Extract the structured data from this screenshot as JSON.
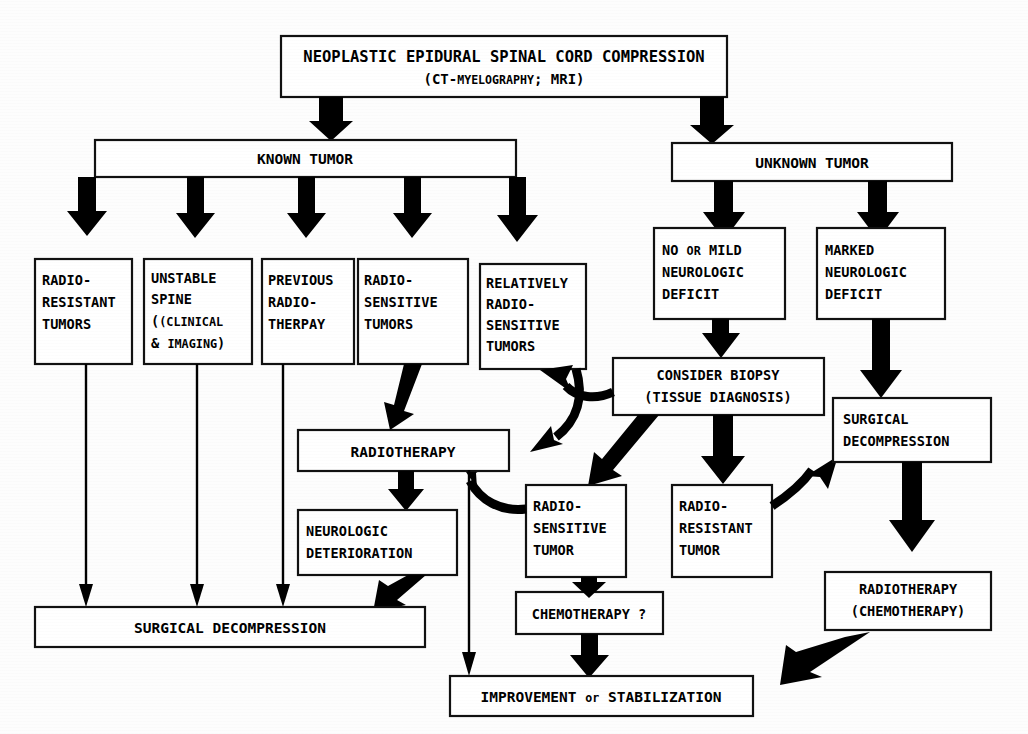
{
  "diagram": {
    "type": "flowchart",
    "root": {
      "line1": "NEOPLASTIC EPIDURAL SPINAL CORD COMPRESSION",
      "line2_a": "(CT-",
      "line2_b": "MYELOGRAPHY",
      "line2_c": "; MRI)"
    },
    "branches": {
      "known": "KNOWN   TUMOR",
      "unknown": "UNKNOWN   TUMOR"
    },
    "known_children": [
      {
        "id": "radio-resistant-tumors",
        "lines": [
          "RADIO-",
          "RESISTANT",
          "TUMORS"
        ]
      },
      {
        "id": "unstable-spine",
        "lines": [
          "UNSTABLE",
          "SPINE"
        ],
        "small_caps_lines": [
          "(CLINICAL",
          "& IMAGING)"
        ]
      },
      {
        "id": "previous-radiotherapy",
        "lines": [
          "PREVIOUS",
          "RADIO-",
          "THERPAY"
        ]
      },
      {
        "id": "radio-sensitive-tumors",
        "lines": [
          "RADIO-",
          "SENSITIVE",
          "TUMORS"
        ]
      },
      {
        "id": "relatively-radio-sensitive-tumors",
        "lines": [
          "RELATIVELY",
          "RADIO-",
          "SENSITIVE",
          "TUMORS"
        ]
      }
    ],
    "unknown_children": [
      {
        "id": "no-or-mild-deficit",
        "lines": [
          "NO or MILD",
          "NEUROLOGIC",
          "DEFICIT"
        ]
      },
      {
        "id": "marked-deficit",
        "lines": [
          "MARKED",
          "NEUROLOGIC",
          "DEFICIT"
        ]
      }
    ],
    "nodes": {
      "radiotherapy": "RADIOTHERAPY",
      "neurologic_deterioration": [
        "NEUROLOGIC",
        "DETERIORATION"
      ],
      "consider_biopsy": [
        "CONSIDER BIOPSY",
        "(TISSUE DIAGNOSIS)"
      ],
      "mid_radio_sensitive_tumor": [
        "RADIO-",
        "SENSITIVE",
        "TUMOR"
      ],
      "mid_radio_resistant_tumor": [
        "RADIO-",
        "RESISTANT",
        "TUMOR"
      ],
      "surgical_decompression_right": [
        "SURGICAL",
        "DECOMPRESSION"
      ],
      "radiotherapy_chemotherapy": [
        "RADIOTHERAPY",
        "(CHEMOTHERAPY)"
      ],
      "chemotherapy_question": "CHEMOTHERAPY ?",
      "surgical_decompression_bottom": "SURGICAL   DECOMPRESSION",
      "improvement": {
        "a": "IMPROVEMENT ",
        "b": "or",
        "c": " STABILIZATION"
      }
    },
    "colors": {
      "ink": "#000000",
      "paper": "#fdfdfd",
      "box_stroke": "#111111"
    }
  }
}
